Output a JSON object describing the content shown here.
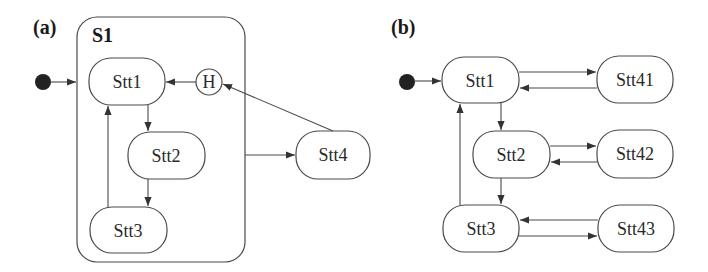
{
  "panels": {
    "a": {
      "label": "(a)",
      "superstate": "S1",
      "history": "H",
      "states": [
        "Stt1",
        "Stt2",
        "Stt3",
        "Stt4"
      ]
    },
    "b": {
      "label": "(b)",
      "states": [
        "Stt1",
        "Stt2",
        "Stt3",
        "Stt41",
        "Stt42",
        "Stt43"
      ]
    }
  },
  "transitions": {
    "a": [
      {
        "from": "initial",
        "to": "S1"
      },
      {
        "from": "H",
        "to": "Stt1"
      },
      {
        "from": "Stt1",
        "to": "Stt2"
      },
      {
        "from": "Stt2",
        "to": "Stt3"
      },
      {
        "from": "Stt3",
        "to": "Stt1"
      },
      {
        "from": "S1",
        "to": "Stt4"
      },
      {
        "from": "Stt4",
        "to": "H"
      }
    ],
    "b": [
      {
        "from": "initial",
        "to": "Stt1"
      },
      {
        "from": "Stt1",
        "to": "Stt41"
      },
      {
        "from": "Stt41",
        "to": "Stt1"
      },
      {
        "from": "Stt1",
        "to": "Stt2"
      },
      {
        "from": "Stt2",
        "to": "Stt42"
      },
      {
        "from": "Stt42",
        "to": "Stt2"
      },
      {
        "from": "Stt2",
        "to": "Stt3"
      },
      {
        "from": "Stt3",
        "to": "Stt43"
      },
      {
        "from": "Stt43",
        "to": "Stt3"
      },
      {
        "from": "Stt3",
        "to": "Stt1"
      }
    ]
  },
  "colors": {
    "stroke": "#4a4a4a",
    "initial_fill": "#222222",
    "text": "#2a2a2a"
  }
}
